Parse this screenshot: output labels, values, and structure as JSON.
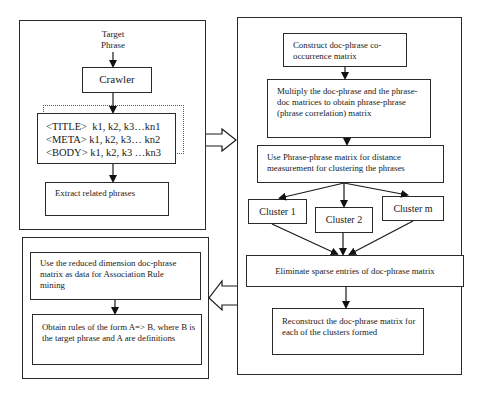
{
  "diagram": {
    "left_top_panel": {
      "input_label": "Target\nPhrase",
      "crawler": "Crawler",
      "tags": [
        "<TITLE>  k1, k2, k3…kn1",
        "<META> k1, k2, k3… kn2",
        "<BODY> k1, k2, k3 …kn3"
      ],
      "extract": "Extract related phrases"
    },
    "right_panel": {
      "construct": "Construct doc-phrase co-occurrence matrix",
      "multiply": "Multiply the doc-phrase and the phrase-doc matrices to obtain phrase-phrase (phrase correlation) matrix",
      "use_phrase": "Use Phrase-phrase matrix for distance measurement for clustering the phrases",
      "clusters": [
        "Cluster 1",
        "Cluster 2",
        "Cluster m"
      ],
      "eliminate": "Eliminate sparse entries of doc-phrase matrix",
      "reconstruct": "Reconstruct the doc-phrase matrix for each of the clusters formed"
    },
    "left_bottom_panel": {
      "use_reduced": "Use the reduced dimension doc-phrase matrix as data for Association Rule mining",
      "obtain_rules": "Obtain rules of the form A=> B, where B is the target phrase and A are definitions"
    },
    "connectors": {
      "left_to_right": "hollow-arrow-right",
      "right_to_left_bottom": "hollow-arrow-left"
    }
  }
}
